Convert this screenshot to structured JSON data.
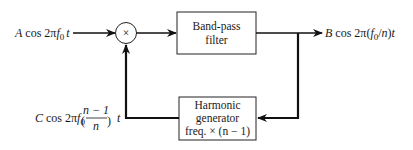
{
  "diagram": {
    "type": "block-diagram",
    "blocks": {
      "multiplier": {
        "symbol": "×"
      },
      "bandpass": {
        "line1": "Band-pass",
        "line2": "filter"
      },
      "harmonic": {
        "line1": "Harmonic",
        "line2": "generator",
        "line3": "freq. × (n − 1)"
      }
    },
    "signals": {
      "input": {
        "amp": "A",
        "func": " cos 2π",
        "f": "f",
        "sub": "0",
        "t": "t"
      },
      "output": {
        "amp": "B",
        "func": " cos 2π(",
        "f": "f",
        "sub": "0",
        "rest": "/",
        "n": "n",
        "close": ")",
        "t": "t"
      },
      "feedback": {
        "amp": "C",
        "func": " cos 2π",
        "f": "f",
        "sub": "0",
        "num": "n − 1",
        "den": "n",
        "t": "t"
      }
    }
  }
}
